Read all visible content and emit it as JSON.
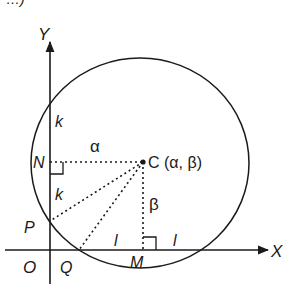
{
  "diagram": {
    "title_fragment": "…)",
    "axes": {
      "x_label": "X",
      "y_label": "Y",
      "origin_label": "O"
    },
    "circle": {
      "center_label": "C (α, β)"
    },
    "points": {
      "N": "N",
      "P": "P",
      "Q": "Q",
      "M": "M"
    },
    "segment_labels": {
      "alpha": "α",
      "beta": "β",
      "k_upper": "k",
      "k_lower": "k",
      "l_left": "l",
      "l_right": "l"
    },
    "colors": {
      "stroke": "#1a1a1a",
      "background": "#ffffff"
    }
  }
}
